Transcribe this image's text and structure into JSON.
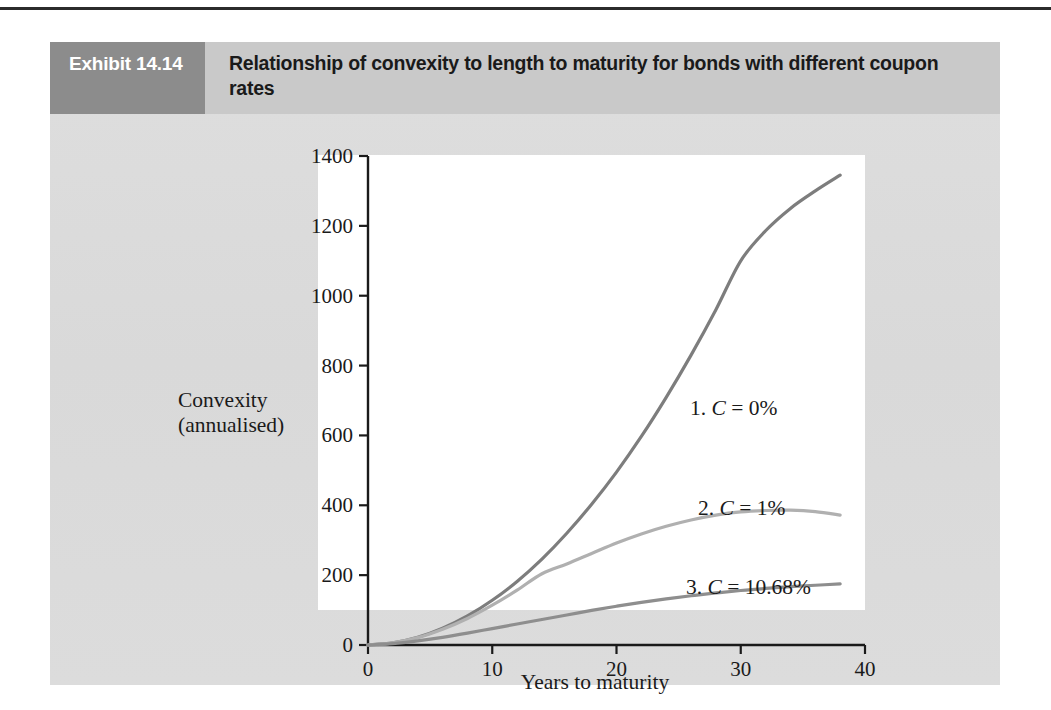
{
  "exhibit": {
    "tag": "Exhibit 14.14",
    "title": "Relationship of convexity to length to maturity for bonds with different coupon rates"
  },
  "colors": {
    "panel_bg": "#dcdcdc",
    "tag_bg": "#8c8c8c",
    "title_bg": "#c9c9c9",
    "plot_bg": "#ffffff",
    "axis": "#1a1a1a",
    "curve1": "#7d7d7d",
    "curve2": "#b0b0b0",
    "curve3": "#8e8e8e"
  },
  "chart_data": {
    "type": "line",
    "title": "Relationship of convexity to length to maturity for bonds with different coupon rates",
    "subtitle": "",
    "xlabel": "Years to maturity",
    "ylabel": "Convexity (annualised)",
    "ylabel_lines": [
      "Convexity",
      "(annualised)"
    ],
    "xlim": [
      0,
      40
    ],
    "ylim": [
      0,
      1400
    ],
    "xticks": [
      0,
      10,
      20,
      30,
      40
    ],
    "yticks": [
      0,
      200,
      400,
      600,
      800,
      1000,
      1200,
      1400
    ],
    "xtick_labels": [
      "0",
      "10",
      "20",
      "30",
      "40"
    ],
    "ytick_labels": [
      "0",
      "200",
      "400",
      "600",
      "800",
      "1000",
      "1200",
      "1400"
    ],
    "grid": false,
    "legend_position": "inline-annotations",
    "series": [
      {
        "name": "1. C = 0%",
        "label_prefix": "1.",
        "symbol": "C",
        "coupon": "0%",
        "color": "#7d7d7d",
        "x": [
          0,
          2,
          4,
          6,
          8,
          10,
          12,
          14,
          16,
          18,
          20,
          22,
          24,
          26,
          28,
          30,
          32,
          34,
          36,
          38
        ],
        "values": [
          0,
          6,
          22,
          48,
          83,
          128,
          182,
          246,
          320,
          403,
          495,
          597,
          709,
          830,
          960,
          1100,
          1186,
          1250,
          1300,
          1345
        ]
      },
      {
        "name": "2. C = 1%",
        "label_prefix": "2.",
        "symbol": "C",
        "coupon": "1%",
        "color": "#b0b0b0",
        "x": [
          0,
          2,
          4,
          6,
          8,
          10,
          12,
          14,
          16,
          18,
          20,
          22,
          24,
          26,
          28,
          30,
          32,
          34,
          36,
          38
        ],
        "values": [
          0,
          6,
          21,
          45,
          76,
          114,
          157,
          204,
          232,
          262,
          292,
          318,
          340,
          358,
          372,
          381,
          385,
          386,
          382,
          372
        ]
      },
      {
        "name": "3. C = 10.68%",
        "label_prefix": "3.",
        "symbol": "C",
        "coupon": "10.68%",
        "color": "#8e8e8e",
        "x": [
          0,
          2,
          4,
          6,
          8,
          10,
          12,
          14,
          16,
          18,
          20,
          22,
          24,
          26,
          28,
          30,
          32,
          34,
          36,
          38
        ],
        "values": [
          0,
          4,
          12,
          22,
          34,
          47,
          60,
          73,
          86,
          99,
          111,
          122,
          132,
          141,
          149,
          156,
          162,
          167,
          171,
          175
        ]
      }
    ],
    "annotations": [
      {
        "text": "1. C = 0%",
        "x": 30.5,
        "y": 790
      },
      {
        "text": "2. C = 1%",
        "x": 31.2,
        "y": 455
      },
      {
        "text": "3. C = 10.68%",
        "x": 30.5,
        "y": 263
      }
    ]
  }
}
